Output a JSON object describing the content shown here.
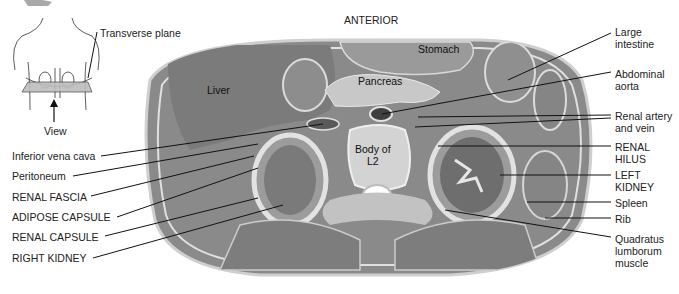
{
  "figure": {
    "orientation_label": "ANTERIOR",
    "inset": {
      "plane_label": "Transverse plane",
      "view_label": "View"
    },
    "organ_labels": {
      "liver": "Liver",
      "stomach": "Stomach",
      "pancreas": "Pancreas",
      "vertebra": "Body of\nL2"
    },
    "left_labels": [
      {
        "text": "Inferior vena cava"
      },
      {
        "text": "Peritoneum"
      },
      {
        "text": "RENAL FASCIA"
      },
      {
        "text": "ADIPOSE CAPSULE"
      },
      {
        "text": "RENAL CAPSULE"
      },
      {
        "text": "RIGHT KIDNEY"
      }
    ],
    "right_labels": [
      {
        "text": "Large\nintestine"
      },
      {
        "text": "Abdominal\naorta"
      },
      {
        "text": "Renal artery\nand vein"
      },
      {
        "text": "RENAL\nHILUS"
      },
      {
        "text": "LEFT\nKIDNEY"
      },
      {
        "text": "Spleen"
      },
      {
        "text": "Rib"
      },
      {
        "text": "Quadratus\nlumborum\nmuscle"
      }
    ]
  }
}
